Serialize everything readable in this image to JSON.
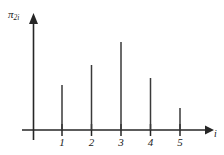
{
  "chart_data": {
    "type": "bar",
    "title": "",
    "subtitle": "",
    "xlabel": "i",
    "ylabel": "π",
    "ylabel_sub": "2i",
    "categories": [
      "1",
      "2",
      "3",
      "4",
      "5"
    ],
    "values": [
      45,
      65,
      88,
      52,
      22
    ],
    "series": [
      {
        "name": "π_2i",
        "values": [
          45,
          65,
          88,
          52,
          22
        ]
      }
    ],
    "xlim": [
      0,
      5.8
    ],
    "ylim": [
      0,
      100
    ],
    "grid": false,
    "legend": null,
    "style": "stem",
    "axis_color": "#262626",
    "stem_color": "#3a3a3a",
    "background": "#ffffff",
    "x_axis_arrow": true,
    "y_axis_arrow": true,
    "annotations": []
  },
  "ticks": {
    "x": [
      "1",
      "2",
      "3",
      "4",
      "5"
    ]
  }
}
